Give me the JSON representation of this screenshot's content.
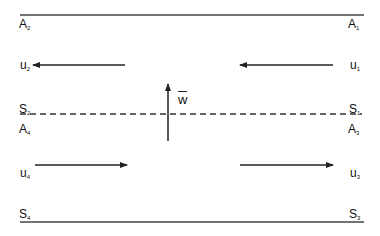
{
  "diagram": {
    "colors": {
      "line": "#333333",
      "text": "#111111",
      "background": "#ffffff"
    },
    "boundaries": {
      "top": {
        "y": 15,
        "x1": 20,
        "x2": 364,
        "style": "solid"
      },
      "middle": {
        "y": 114,
        "x1": 20,
        "x2": 362,
        "style": "dashed"
      },
      "bottom": {
        "y": 222,
        "x1": 20,
        "x2": 364,
        "style": "solid"
      }
    },
    "labels": {
      "A2": {
        "base": "A",
        "sub": "2"
      },
      "A1": {
        "base": "A",
        "sub": "1"
      },
      "u2": {
        "base": "u",
        "sub": "2"
      },
      "u1": {
        "base": "u",
        "sub": "1"
      },
      "S2": {
        "base": "S",
        "sub": "2"
      },
      "S1": {
        "base": "S",
        "sub": "1"
      },
      "A4": {
        "base": "A",
        "sub": "4"
      },
      "A3": {
        "base": "A",
        "sub": "3"
      },
      "u4": {
        "base": "u",
        "sub": "4"
      },
      "u3": {
        "base": "u",
        "sub": "3"
      },
      "S4": {
        "base": "S",
        "sub": "4"
      },
      "S3": {
        "base": "S",
        "sub": "3"
      },
      "w": "w"
    },
    "arrows": [
      {
        "name": "u2-arrow",
        "direction": "left",
        "x1": 125,
        "x2": 33,
        "y": 65
      },
      {
        "name": "u1-arrow",
        "direction": "left",
        "x1": 333,
        "x2": 240,
        "y": 65
      },
      {
        "name": "u4-arrow",
        "direction": "right",
        "x1": 35,
        "x2": 127,
        "y": 165
      },
      {
        "name": "u3-arrow",
        "direction": "right",
        "x1": 240,
        "x2": 333,
        "y": 165
      },
      {
        "name": "w-arrow",
        "direction": "up",
        "x": 168,
        "y1": 141,
        "y2": 84
      }
    ]
  }
}
